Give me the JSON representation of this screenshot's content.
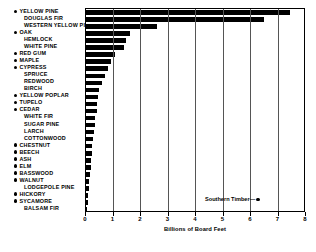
{
  "chart_data": {
    "type": "bar",
    "orientation": "horizontal",
    "title": "",
    "xlabel": "Billions of Board Feet",
    "ylabel": "",
    "xlim": [
      0,
      8
    ],
    "xticks": [
      0,
      1,
      2,
      3,
      4,
      5,
      6,
      7,
      8
    ],
    "grid": "vertical",
    "legend": {
      "text": "Southern Timber",
      "dash": "—",
      "marker": "●",
      "position": "bottom-right"
    },
    "marker_meaning": "● indicates Southern Timber species",
    "categories": [
      "YELLOW PINE",
      "DOUGLAS FIR",
      "WESTERN YELLOW PINE",
      "OAK",
      "HEMLOCK",
      "WHITE PINE",
      "RED GUM",
      "MAPLE",
      "CYPRESS",
      "SPRUCE",
      "REDWOOD",
      "BIRCH",
      "YELLOW POPLAR",
      "TUPELO",
      "CEDAR",
      "WHITE FIR",
      "SUGAR PINE",
      "LARCH",
      "COTTONWOOD",
      "CHESTNUT",
      "BEECH",
      "ASH",
      "ELM",
      "BASSWOOD",
      "WALNUT",
      "LODGEPOLE PINE",
      "HICKORY",
      "SYCAMORE",
      "BALSAM FIR"
    ],
    "values": [
      7.45,
      6.5,
      2.6,
      1.65,
      1.5,
      1.42,
      1.1,
      0.95,
      0.85,
      0.72,
      0.62,
      0.52,
      0.48,
      0.44,
      0.42,
      0.38,
      0.36,
      0.33,
      0.3,
      0.27,
      0.25,
      0.23,
      0.21,
      0.18,
      0.15,
      0.13,
      0.12,
      0.1,
      0.08
    ],
    "southern_flags": [
      true,
      false,
      false,
      true,
      false,
      false,
      true,
      true,
      true,
      false,
      false,
      false,
      true,
      true,
      true,
      false,
      false,
      false,
      false,
      true,
      true,
      true,
      true,
      true,
      true,
      false,
      true,
      true,
      false
    ]
  },
  "axis": {
    "xlabel": "Billions of Board Feet",
    "ticks": [
      "0",
      "1",
      "2",
      "3",
      "4",
      "5",
      "6",
      "7",
      "8"
    ]
  },
  "legend": {
    "label": "Southern Timber",
    "separator": "—"
  }
}
